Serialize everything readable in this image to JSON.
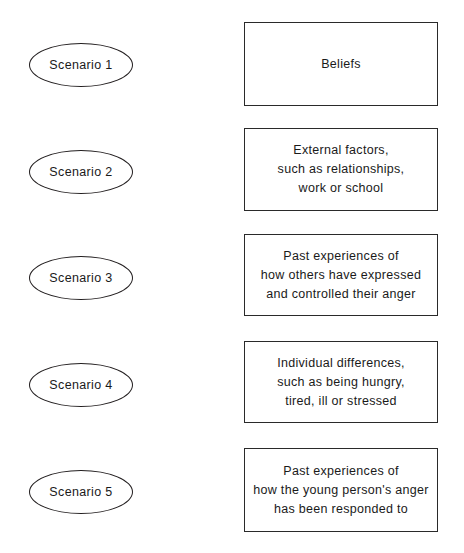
{
  "page": {
    "title_clipped": "• • • • • • • • • • • • • • • •",
    "background_color": "#ffffff",
    "ink_color": "#1a1a1a",
    "border_color": "#231f20"
  },
  "rows": [
    {
      "scenario_label": "Scenario 1",
      "box_lines": [
        "Beliefs"
      ]
    },
    {
      "scenario_label": "Scenario 2",
      "box_lines": [
        "External factors,",
        "such as relationships,",
        "work or school"
      ]
    },
    {
      "scenario_label": "Scenario 3",
      "box_lines": [
        "Past experiences of",
        "how others have expressed",
        "and controlled their anger"
      ]
    },
    {
      "scenario_label": "Scenario 4",
      "box_lines": [
        "Individual differences,",
        "such as being hungry,",
        "tired, ill or stressed"
      ]
    },
    {
      "scenario_label": "Scenario 5",
      "box_lines": [
        "Past experiences of",
        "how the young person's anger",
        "has been responded to"
      ]
    }
  ]
}
